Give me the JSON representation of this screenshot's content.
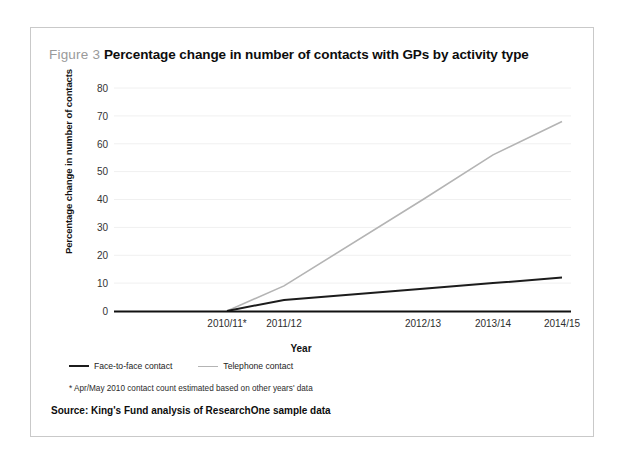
{
  "figure": {
    "label": "Figure 3",
    "title": "Percentage change in number of contacts with GPs by activity type"
  },
  "legend": {
    "face_to_face": "Face-to-face contact",
    "telephone": "Telephone contact"
  },
  "footnote": "* Apr/May 2010 contact count estimated based on other years' data",
  "source": "Source: King's Fund analysis of ResearchOne sample data",
  "colors": {
    "face_to_face_line": "#1c1c1c",
    "telephone_line": "#b4b4b4",
    "axis": "#111111",
    "gridline": "#f0f0f0",
    "figure_label": "#9a9a9a",
    "border": "#c9c9c9"
  },
  "chart_data": {
    "type": "line",
    "title": "Percentage change in number of contacts with GPs by activity type",
    "xlabel": "Year",
    "ylabel": "Percentage change in number of contacts",
    "categories": [
      "2010/11*",
      "2011/12",
      "2012/13",
      "2013/14",
      "2014/15"
    ],
    "series": [
      {
        "name": "Face-to-face contact",
        "values": [
          0,
          4,
          8,
          10,
          12
        ]
      },
      {
        "name": "Telephone contact",
        "values": [
          0,
          9,
          40,
          56,
          68
        ]
      }
    ],
    "ylim": [
      0,
      80
    ],
    "yticks": [
      0,
      10,
      20,
      30,
      40,
      50,
      60,
      70,
      80
    ],
    "ytick_labels": [
      "0",
      "10",
      "20",
      "30",
      "40",
      "50",
      "60",
      "70",
      "80"
    ],
    "grid": true,
    "legend_position": "below-axis-left"
  }
}
